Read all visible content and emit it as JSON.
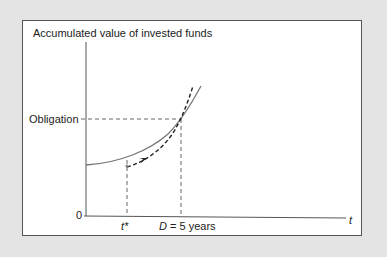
{
  "figure": {
    "title": "Accumulated value of invested funds",
    "y_axis_label": "Accumulated value of invested funds",
    "x_axis_label": "t",
    "origin_label": "0",
    "obligation_label": "Obligation",
    "t_star_label": "t*",
    "duration_label_var": "D",
    "duration_label_rest": " = 5 years"
  },
  "colors": {
    "background": "#e4e4e4",
    "panel": "#ffffff",
    "axis": "#555555",
    "solid_curve": "#777777",
    "dashed_curve": "#222222",
    "guide_lines": "#555555"
  }
}
